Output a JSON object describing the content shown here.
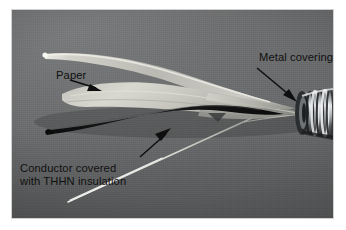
{
  "figure": {
    "type": "photograph",
    "background_color": "#6d6e6f",
    "border_color": "#ffffff",
    "ink_color": "#101010"
  },
  "annotations": [
    {
      "id": "metal-covering",
      "text": "Metal covering (armor)",
      "arrow": {
        "from": [
          245,
          58
        ],
        "to": [
          285,
          92
        ]
      }
    },
    {
      "id": "paper",
      "text": "Paper",
      "arrow": {
        "from": [
          70,
          70
        ],
        "to": [
          97,
          80
        ]
      }
    },
    {
      "id": "conductor",
      "line1": "Conductor covered",
      "line2": "with THHN insulation",
      "arrow": {
        "from": [
          130,
          148
        ],
        "to": [
          164,
          117
        ]
      }
    }
  ],
  "parts": {
    "paper_wrap": "Paper",
    "conductor": "Conductor covered with THHN insulation",
    "armor": "Metal covering (armor)",
    "bonding_wire": "bare bonding wire"
  },
  "colors": {
    "paper": "#c9c9c2",
    "paper_highlight": "#efefe8",
    "conductor": "#141414",
    "armor": "#b9bcbe",
    "armor_shadow": "#3c3e40",
    "wire": "#f2f2ee",
    "backdrop": "#6d6e6f"
  }
}
